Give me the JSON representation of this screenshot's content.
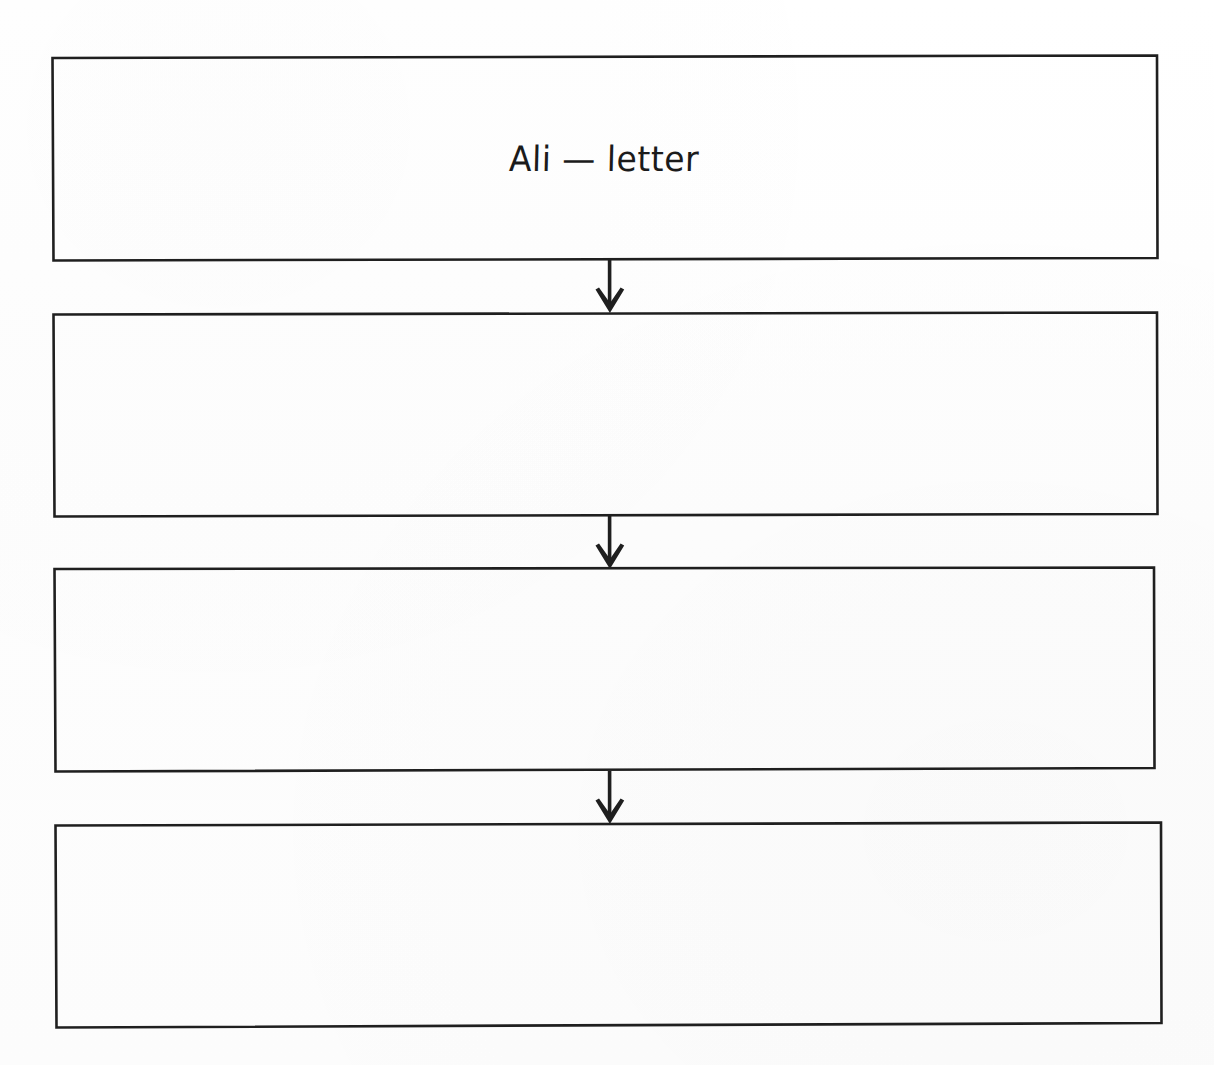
{
  "document": {
    "type": "hand-drawn flowchart",
    "background_color": "#fefefe",
    "ink_color": "#1b1b1b"
  },
  "flowchart": {
    "orientation": "vertical",
    "node_count": 4,
    "connector_count": 3,
    "nodes": [
      {
        "id": "node-1",
        "label": "Ali — letter",
        "empty": false,
        "x": 51,
        "y": 55,
        "width": 1107,
        "height": 206
      },
      {
        "id": "node-2",
        "label": "",
        "empty": true,
        "x": 52,
        "y": 312,
        "width": 1106,
        "height": 205
      },
      {
        "id": "node-3",
        "label": "",
        "empty": true,
        "x": 53,
        "y": 567,
        "width": 1102,
        "height": 205
      },
      {
        "id": "node-4",
        "label": "",
        "empty": true,
        "x": 54,
        "y": 822,
        "width": 1108,
        "height": 206
      }
    ],
    "connectors": [
      {
        "id": "arrow-1",
        "from": "node-1",
        "to": "node-2",
        "direction": "down",
        "x": 610,
        "y": 261,
        "length": 51
      },
      {
        "id": "arrow-2",
        "from": "node-2",
        "to": "node-3",
        "direction": "down",
        "x": 610,
        "y": 517,
        "length": 50
      },
      {
        "id": "arrow-3",
        "from": "node-3",
        "to": "node-4",
        "direction": "down",
        "x": 610,
        "y": 772,
        "length": 50
      }
    ]
  }
}
